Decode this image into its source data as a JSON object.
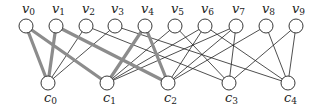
{
  "diagram": {
    "type": "bipartite-graph",
    "top_nodes": [
      {
        "id": "v0",
        "name": "v",
        "sub": "0",
        "x": 26
      },
      {
        "id": "v1",
        "name": "v",
        "sub": "1",
        "x": 56
      },
      {
        "id": "v2",
        "name": "v",
        "sub": "2",
        "x": 86
      },
      {
        "id": "v3",
        "name": "v",
        "sub": "3",
        "x": 115
      },
      {
        "id": "v4",
        "name": "v",
        "sub": "4",
        "x": 145
      },
      {
        "id": "v5",
        "name": "v",
        "sub": "5",
        "x": 175
      },
      {
        "id": "v6",
        "name": "v",
        "sub": "6",
        "x": 205
      },
      {
        "id": "v7",
        "name": "v",
        "sub": "7",
        "x": 236
      },
      {
        "id": "v8",
        "name": "v",
        "sub": "8",
        "x": 266
      },
      {
        "id": "v9",
        "name": "v",
        "sub": "9",
        "x": 296
      }
    ],
    "bottom_nodes": [
      {
        "id": "c0",
        "name": "c",
        "sub": "0",
        "x": 48
      },
      {
        "id": "c1",
        "name": "c",
        "sub": "1",
        "x": 107
      },
      {
        "id": "c2",
        "name": "c",
        "sub": "2",
        "x": 168
      },
      {
        "id": "c3",
        "name": "c",
        "sub": "3",
        "x": 229
      },
      {
        "id": "c4",
        "name": "c",
        "sub": "4",
        "x": 288
      }
    ],
    "top_y": 26,
    "bottom_y": 83,
    "node_radius": 7,
    "edges": [
      {
        "from": "v0",
        "to": "c0",
        "thick": true
      },
      {
        "from": "v1",
        "to": "c0",
        "thick": true
      },
      {
        "from": "v2",
        "to": "c0",
        "thick": false
      },
      {
        "from": "v3",
        "to": "c0",
        "thick": false
      },
      {
        "from": "v0",
        "to": "c1",
        "thick": true
      },
      {
        "from": "v4",
        "to": "c1",
        "thick": true
      },
      {
        "from": "v5",
        "to": "c1",
        "thick": false
      },
      {
        "from": "v6",
        "to": "c1",
        "thick": false
      },
      {
        "from": "v7",
        "to": "c1",
        "thick": false
      },
      {
        "from": "v1",
        "to": "c2",
        "thick": true
      },
      {
        "from": "v4",
        "to": "c2",
        "thick": true
      },
      {
        "from": "v6",
        "to": "c2",
        "thick": false
      },
      {
        "from": "v7",
        "to": "c2",
        "thick": false
      },
      {
        "from": "v8",
        "to": "c2",
        "thick": false
      },
      {
        "from": "v2",
        "to": "c3",
        "thick": false
      },
      {
        "from": "v5",
        "to": "c3",
        "thick": false
      },
      {
        "from": "v7",
        "to": "c3",
        "thick": false
      },
      {
        "from": "v9",
        "to": "c3",
        "thick": false
      },
      {
        "from": "v3",
        "to": "c4",
        "thick": false
      },
      {
        "from": "v6",
        "to": "c4",
        "thick": false
      },
      {
        "from": "v8",
        "to": "c4",
        "thick": false
      },
      {
        "from": "v9",
        "to": "c4",
        "thick": false
      }
    ],
    "colors": {
      "thin_edge": "#222222",
      "thick_edge": "#8c8c8c",
      "node_stroke": "#222222",
      "node_fill": "#ffffff"
    }
  }
}
